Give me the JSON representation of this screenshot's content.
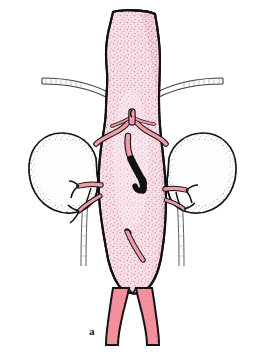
{
  "figure": {
    "label": "a",
    "label_position": {
      "x": 89,
      "y": 325
    },
    "caption_text": "a",
    "type": "anatomical-line-illustration",
    "background_color": "#ffffff",
    "outline_color": "#111111"
  },
  "colors": {
    "aneurysm_fill": "#f7dfe8",
    "aneurysm_stipple": "#e9a8c0",
    "vessel_fill": "#f09ba8",
    "vessel_fill_dark": "#e8808f",
    "iliac_fill": "#f4919e",
    "kidney_fill": "#ffffff",
    "kidney_stipple": "#6b6b6b",
    "occluded_vessel": "#111111",
    "outline": "#111111",
    "tube_fill": "#fdfdfd",
    "tube_outline": "#4a4a4a",
    "ureter_line": "#5a5a5a"
  },
  "structures": [
    {
      "name": "aneurysm-sac",
      "label": "abdominal aortic aneurysm",
      "fill": "#f7dfe8",
      "stippled": true
    },
    {
      "name": "proximal-aorta",
      "label": "proximal aorta / neck",
      "fill": "#f7dfe8",
      "stippled": true
    },
    {
      "name": "left-kidney",
      "label": "left kidney",
      "fill": "#ffffff",
      "stippled": true
    },
    {
      "name": "right-kidney",
      "label": "right kidney",
      "fill": "#ffffff",
      "stippled": true
    },
    {
      "name": "renal-artery-branches",
      "label": "renal artery branches",
      "fill": "#f09ba8",
      "stippled": false
    },
    {
      "name": "left-renal-hilum-vessels",
      "label": "left renal hilar vessels",
      "fill": "#f09ba8",
      "stippled": false
    },
    {
      "name": "right-renal-hilum-vessels",
      "label": "right renal hilar vessels",
      "fill": "#f09ba8",
      "stippled": false
    },
    {
      "name": "occluded-vessel-segment",
      "label": "occluded / thrombosed vessel segment",
      "fill": "#111111",
      "stippled": false
    },
    {
      "name": "inferior-mesenteric-artery-stub",
      "label": "inferior mesenteric artery stub",
      "fill": "#f09ba8",
      "stippled": false
    },
    {
      "name": "left-iliac-artery",
      "label": "left common iliac artery",
      "fill": "#f4919e",
      "stippled": true
    },
    {
      "name": "right-iliac-artery",
      "label": "right common iliac artery",
      "fill": "#f4919e",
      "stippled": true
    },
    {
      "name": "left-upper-tube",
      "label": "left lateral tubular structure",
      "fill": "#fdfdfd",
      "stippled": false
    },
    {
      "name": "right-upper-tube",
      "label": "right lateral tubular structure",
      "fill": "#fdfdfd",
      "stippled": false
    },
    {
      "name": "left-ureter",
      "label": "left ureter",
      "fill": "none",
      "stippled": false
    },
    {
      "name": "right-ureter",
      "label": "right ureter",
      "fill": "none",
      "stippled": false
    }
  ]
}
